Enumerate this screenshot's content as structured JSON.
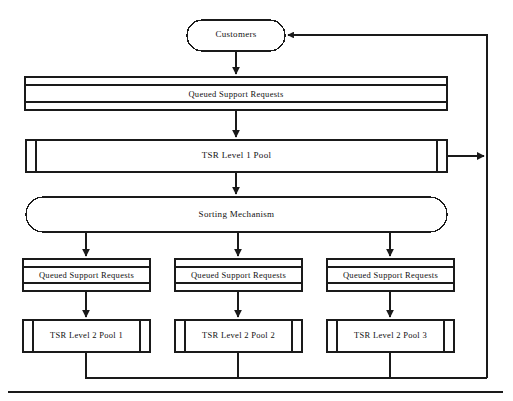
{
  "diagram": {
    "stroke_color": "#1a1a1a",
    "fill_color": "#ffffff",
    "background_color": "#ffffff",
    "nodes": {
      "customers": {
        "label": "Customers",
        "shape": "stadium"
      },
      "queue_top": {
        "label": "Queued Support Requests",
        "shape": "multi-bar-queue"
      },
      "tsr_level1_pool": {
        "label": "TSR Level 1 Pool",
        "shape": "pool-bar"
      },
      "sorting_mechanism": {
        "label": "Sorting  Mechanism",
        "shape": "stadium"
      },
      "queue_1": {
        "label": "Queued Support Requests",
        "shape": "multi-bar-queue"
      },
      "queue_2": {
        "label": "Queued Support Requests",
        "shape": "multi-bar-queue"
      },
      "queue_3": {
        "label": "Queued Support Requests",
        "shape": "multi-bar-queue"
      },
      "tsr_level2_pool_1": {
        "label": "TSR Level 2 Pool 1",
        "shape": "pool-bar"
      },
      "tsr_level2_pool_2": {
        "label": "TSR  Level 2 Pool 2",
        "shape": "pool-bar"
      },
      "tsr_level2_pool_3": {
        "label": "TSR Level 2 Pool 3",
        "shape": "pool-bar"
      }
    },
    "edges": [
      {
        "from": "customers",
        "to": "queue_top",
        "direction": "down",
        "arrow": true
      },
      {
        "from": "queue_top",
        "to": "tsr_level1_pool",
        "direction": "down",
        "arrow": true
      },
      {
        "from": "tsr_level1_pool",
        "to": "return_bus",
        "direction": "right",
        "arrow": true
      },
      {
        "from": "tsr_level1_pool",
        "to": "sorting_mechanism",
        "direction": "down",
        "arrow": true
      },
      {
        "from": "sorting_mechanism",
        "to": "queue_1",
        "direction": "down",
        "arrow": true
      },
      {
        "from": "sorting_mechanism",
        "to": "queue_2",
        "direction": "down",
        "arrow": true
      },
      {
        "from": "sorting_mechanism",
        "to": "queue_3",
        "direction": "down",
        "arrow": true
      },
      {
        "from": "queue_1",
        "to": "tsr_level2_pool_1",
        "direction": "down",
        "arrow": true
      },
      {
        "from": "queue_2",
        "to": "tsr_level2_pool_2",
        "direction": "down",
        "arrow": true
      },
      {
        "from": "queue_3",
        "to": "tsr_level2_pool_3",
        "direction": "down",
        "arrow": true
      },
      {
        "from": "tsr_level2_pool_1",
        "to": "return_bus",
        "direction": "down-right",
        "arrow": false
      },
      {
        "from": "tsr_level2_pool_2",
        "to": "return_bus",
        "direction": "down-right",
        "arrow": false
      },
      {
        "from": "tsr_level2_pool_3",
        "to": "return_bus",
        "direction": "down-right",
        "arrow": false
      },
      {
        "from": "return_bus",
        "to": "customers",
        "direction": "up-left",
        "arrow": true
      }
    ]
  }
}
